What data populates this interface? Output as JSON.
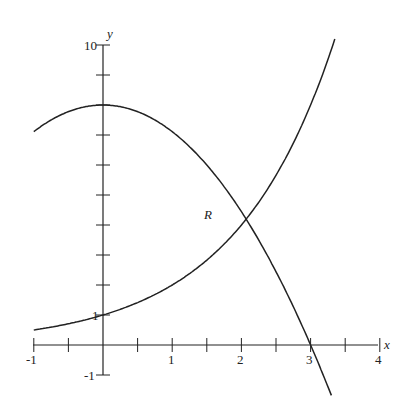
{
  "figure": {
    "x_axis": {
      "label": "x",
      "ticks": [
        "-1",
        "1",
        "2",
        "3",
        "4"
      ],
      "min": -1,
      "max": 4,
      "minor_step": 0.5
    },
    "y_axis": {
      "label": "y",
      "ticks": [
        "10",
        "1",
        "-1"
      ],
      "min": -1,
      "max": 10,
      "step": 1
    },
    "region_label": "R",
    "curves": [
      {
        "name": "parabola",
        "expression": "y = 8 - (8/9)x^2",
        "domain": [
          -1,
          3.3
        ]
      },
      {
        "name": "exponential",
        "expression": "y = 2^x",
        "domain": [
          -1,
          3.35
        ]
      }
    ],
    "line_color": "#222222"
  }
}
